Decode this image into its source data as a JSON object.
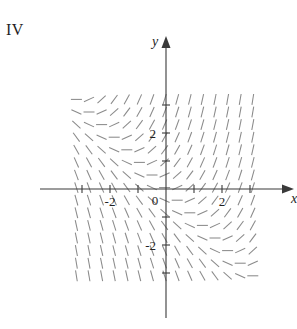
{
  "figure": {
    "panel_label": "IV",
    "caption": ""
  },
  "chart_data": {
    "type": "scatter",
    "subtype": "slope-field",
    "title": "IV",
    "xlabel": "x",
    "ylabel": "y",
    "xlim": [
      -3.5,
      3.6
    ],
    "ylim": [
      -3.6,
      3.5
    ],
    "grid": false,
    "legend": null,
    "x_ticks": [
      -2,
      2
    ],
    "x_tick_labels": [
      "-2",
      "2"
    ],
    "y_ticks": [
      -2,
      2
    ],
    "y_tick_labels": [
      "-2",
      "2"
    ],
    "origin_label": "0",
    "minor_x_ticks": [
      -3,
      -2,
      -1,
      1,
      2,
      3
    ],
    "minor_y_ticks": [
      -3,
      -2,
      -1,
      1,
      2,
      3
    ],
    "field_domain_x": [
      -3.2,
      3.3
    ],
    "field_domain_y": [
      -3.3,
      3.2
    ],
    "field_sample_step": 0.45,
    "slope_expression": "x + y",
    "segment_color": "#8a8a8a",
    "axis_color": "#3a3a3a",
    "segment_length_px": 11
  },
  "axes": {
    "x_axis_name": "x",
    "y_axis_name": "y",
    "origin_text": "0"
  }
}
